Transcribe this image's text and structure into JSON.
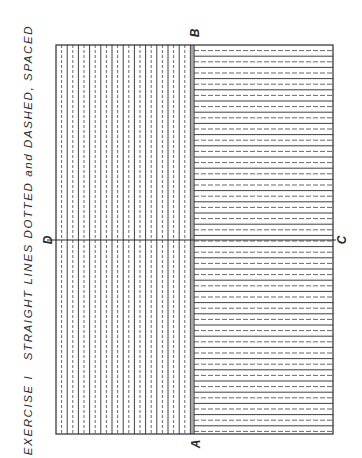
{
  "title": "EXERCISE I   STRAIGHT LINES DOTTED and DASHED, SPACED",
  "labels": {
    "a": "A",
    "b": "B",
    "c": "C",
    "d": "D"
  },
  "diagram": {
    "frame": {
      "x": 56,
      "y": 45,
      "width": 277,
      "height": 389
    },
    "divider_x": 194,
    "left_region": {
      "orientation": "vertical",
      "pattern": [
        "solid",
        "dashed"
      ],
      "spacing": 5.6
    },
    "right_region": {
      "orientation": "horizontal",
      "pattern": [
        "solid",
        "dashed"
      ],
      "spacing": 5.6
    },
    "center_line": {
      "from": "D",
      "to": "C",
      "y": 240
    },
    "line_color": "#2a2a2a"
  }
}
